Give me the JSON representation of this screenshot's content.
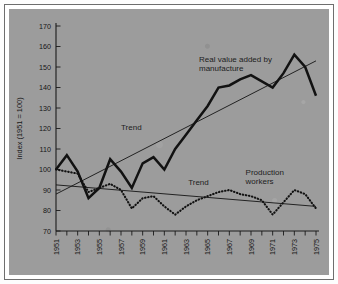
{
  "figure": {
    "background_color": "#9c9c9c",
    "frame_color": "#6e6e6e",
    "paper_color": "#ffffff"
  },
  "chart_data": {
    "type": "line",
    "title": "",
    "subtitle": "",
    "xlabel": "",
    "ylabel": "Index (1951 = 100)",
    "ylim": [
      70,
      170
    ],
    "xlim": [
      1951,
      1975
    ],
    "ytick_step": 10,
    "yticks": [
      70,
      80,
      90,
      100,
      110,
      120,
      130,
      140,
      150,
      160,
      170
    ],
    "ytick_labels": [
      "70",
      "80",
      "90",
      "100",
      "110",
      "120",
      "130",
      "140",
      "150",
      "160",
      "170"
    ],
    "x": [
      1951,
      1952,
      1953,
      1954,
      1955,
      1956,
      1957,
      1958,
      1959,
      1960,
      1961,
      1962,
      1963,
      1964,
      1965,
      1966,
      1967,
      1968,
      1969,
      1970,
      1971,
      1972,
      1973,
      1974,
      1975
    ],
    "xticks": [
      1951,
      1952,
      1953,
      1954,
      1955,
      1956,
      1957,
      1958,
      1959,
      1960,
      1961,
      1962,
      1963,
      1964,
      1965,
      1966,
      1967,
      1968,
      1969,
      1970,
      1971,
      1972,
      1973,
      1974,
      1975
    ],
    "xtick_labels": [
      "1951",
      "",
      "1953",
      "",
      "1955",
      "",
      "1957",
      "",
      "1959",
      "",
      "1961",
      "",
      "1963",
      "",
      "1965",
      "",
      "1967",
      "",
      "1969",
      "",
      "1971",
      "",
      "1973",
      "",
      "1975"
    ],
    "xtick_labels_shown": [
      "1951",
      "1953",
      "1955",
      "1957",
      "1959",
      "1961",
      "1963",
      "1965",
      "1967",
      "1969",
      "1971",
      "1973",
      "1975"
    ],
    "xtick_rotation": 90,
    "grid": false,
    "legend_position": "inline-annotations",
    "series": [
      {
        "name": "Real value added by manufacture",
        "style": "solid",
        "color": "#121212",
        "line_width": 2.5,
        "values": [
          100,
          107,
          99,
          86,
          91,
          105,
          99,
          91,
          103,
          106,
          100,
          110,
          117,
          124,
          131,
          140,
          141,
          144,
          146,
          143,
          140,
          147,
          156,
          150,
          136
        ]
      },
      {
        "name": "Production workers",
        "style": "dotted",
        "color": "#121212",
        "line_width": 2.1,
        "values": [
          100,
          99,
          98,
          89,
          91,
          93,
          90,
          81,
          86,
          87,
          82,
          78,
          82,
          85,
          87,
          89,
          90,
          88,
          87,
          85,
          78,
          84,
          90,
          88,
          81
        ]
      }
    ],
    "trend_lines": [
      {
        "name": "Trend (real value added)",
        "label": "Trend",
        "x_start": 1951,
        "y_start": 88,
        "x_end": 1975,
        "y_end": 153
      },
      {
        "name": "Trend (production workers)",
        "label": "Trend",
        "x_start": 1951,
        "y_start": 92.5,
        "x_end": 1975,
        "y_end": 82
      }
    ],
    "annotations": [
      {
        "name": "real-value-added-label",
        "text_line_1": "Real value added by",
        "text_line_2": "manufacture",
        "x": 1964.2,
        "y": 152.5
      },
      {
        "name": "production-workers-label",
        "text_line_1": "Production",
        "text_line_2": "workers",
        "x": 1968.5,
        "y": 97.5
      },
      {
        "name": "trend-upper-label",
        "text_line_1": "Trend",
        "x": 1957.0,
        "y": 119.5
      },
      {
        "name": "trend-lower-label",
        "text_line_1": "Trend",
        "x": 1963.2,
        "y": 92.5
      }
    ]
  }
}
